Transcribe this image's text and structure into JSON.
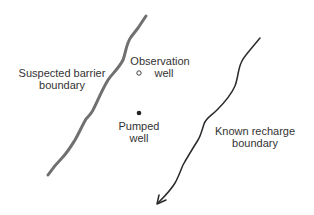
{
  "diagram": {
    "barrier": {
      "label_line1": "Suspected barrier",
      "label_line2": "boundary",
      "color": "#6b6b6b"
    },
    "observation_well": {
      "label_line1": "Observation",
      "label_line2": "well",
      "marker": "open-circle"
    },
    "pumped_well": {
      "label_line1": "Pumped",
      "label_line2": "well",
      "marker": "filled-dot"
    },
    "recharge": {
      "label_line1": "Known recharge",
      "label_line2": "boundary",
      "color": "#2a2a2a",
      "direction": "arrow-down-left"
    }
  }
}
